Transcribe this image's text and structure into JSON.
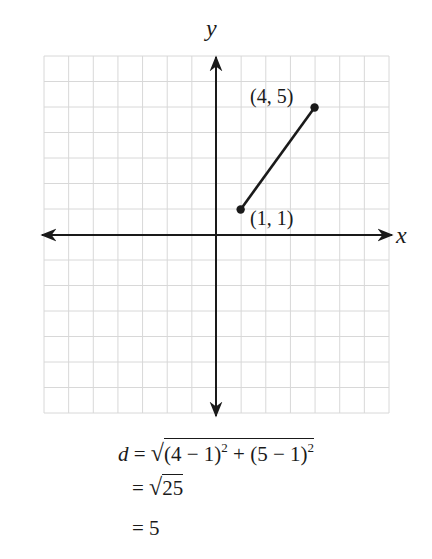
{
  "diagram": {
    "grid": {
      "columns": 14,
      "rows": 14,
      "x_min": -7,
      "x_max": 7,
      "y_min": -7,
      "y_max": 7,
      "grid_color": "#d8d8d8",
      "axis_color": "#1a1a1a"
    },
    "axes": {
      "x_label": "x",
      "y_label": "y"
    },
    "points": [
      {
        "x": 1,
        "y": 1,
        "label": "(1, 1)"
      },
      {
        "x": 4,
        "y": 5,
        "label": "(4, 5)"
      }
    ],
    "segment": {
      "from": [
        1,
        1
      ],
      "to": [
        4,
        5
      ]
    }
  },
  "formula": {
    "line1": {
      "lhs": "d",
      "eq": "=",
      "radicand_parts": [
        "(4 − 1)",
        "2",
        " + (5 − 1)",
        "2"
      ]
    },
    "line2": {
      "eq": "=",
      "radicand": "25"
    },
    "line3": {
      "eq": "=",
      "value": "5"
    }
  }
}
